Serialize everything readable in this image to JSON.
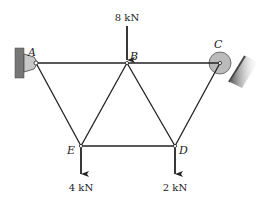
{
  "diagram": {
    "type": "truss",
    "nodes": {
      "A": {
        "label": "A",
        "x": 36,
        "y": 63,
        "support": "pin"
      },
      "B": {
        "label": "B",
        "x": 127,
        "y": 63
      },
      "C": {
        "label": "C",
        "x": 220,
        "y": 63,
        "support": "roller-inclined"
      },
      "D": {
        "label": "D",
        "x": 175,
        "y": 146
      },
      "E": {
        "label": "E",
        "x": 81,
        "y": 146
      }
    },
    "members": [
      [
        "A",
        "B"
      ],
      [
        "B",
        "C"
      ],
      [
        "A",
        "E"
      ],
      [
        "E",
        "B"
      ],
      [
        "B",
        "D"
      ],
      [
        "D",
        "C"
      ],
      [
        "E",
        "D"
      ]
    ],
    "loads": [
      {
        "node": "B",
        "label": "8 kN",
        "direction": "down"
      },
      {
        "node": "E",
        "label": "4 kN",
        "direction": "down"
      },
      {
        "node": "D",
        "label": "2 kN",
        "direction": "down"
      }
    ],
    "colors": {
      "line": "#222222",
      "support": "#999999",
      "roller": "#bbbbbb"
    }
  }
}
